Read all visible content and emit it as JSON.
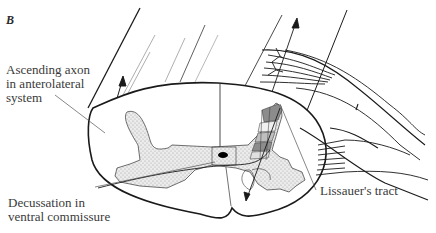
{
  "figure": {
    "panel_letter": "B",
    "labels": {
      "ascending_axon": [
        "Ascending axon",
        "in anterolateral",
        "system"
      ],
      "decussation": [
        "Decussation in",
        "ventral commissure"
      ],
      "lissauer": "Lissauer's tract"
    },
    "colors": {
      "line": "#1a1a1a",
      "thin_line": "#555555",
      "gray_matter_fill": "#d9d9d9",
      "lamina_dark": "#8c8c8c",
      "lamina_light": "#bfbfbf",
      "text": "#3a3a3a"
    }
  }
}
